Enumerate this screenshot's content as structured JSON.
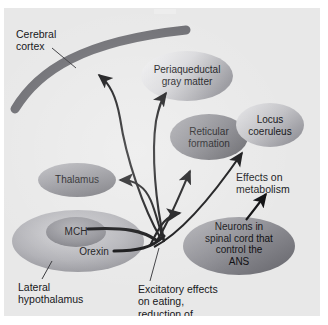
{
  "figure": {
    "type": "diagram",
    "background_color": "#e8e8e8",
    "page_color": "#ffffff"
  },
  "nodes": [
    {
      "id": "cerebral_cortex_band",
      "label": "",
      "shape": "arc-band",
      "color": "#6e6e73",
      "note": "thick curved band representing cortex"
    },
    {
      "id": "periaqueductal",
      "label": "Periaqueductal\ngray matter",
      "shape": "ellipse",
      "fill_light": "#f2f2f2",
      "fill_dark": "#9a9a9f"
    },
    {
      "id": "reticular",
      "label": "Reticular\nformation",
      "shape": "ellipse",
      "fill_light": "#9e9ea3",
      "fill_dark": "#6b6b70"
    },
    {
      "id": "locus",
      "label": "Locus\ncoeruleus",
      "shape": "ellipse",
      "fill_light": "#e3e3e5",
      "fill_dark": "#9d9da2"
    },
    {
      "id": "thalamus",
      "label": "Thalamus",
      "shape": "ellipse",
      "fill_light": "#b9b9bd",
      "fill_dark": "#76767b"
    },
    {
      "id": "lateral_hypothalamus",
      "label": "",
      "shape": "ellipse",
      "fill_light": "#c8c8cb",
      "fill_dark": "#8d8d92"
    },
    {
      "id": "mch_core",
      "label": "MCH",
      "shape": "ellipse",
      "fill_light": "#a7a7ac",
      "fill_dark": "#7a7a7f"
    },
    {
      "id": "orexin",
      "label": "Orexin",
      "shape": "text-on-ellipse"
    },
    {
      "id": "spinal_neurons",
      "label": "Neurons in\nspinal cord that\ncontrol the\nANS",
      "shape": "ellipse",
      "fill_light": "#a3a3a8",
      "fill_dark": "#74747a"
    }
  ],
  "callouts": [
    {
      "id": "cerebral_cortex_label",
      "text": "Cerebral\ncortex"
    },
    {
      "id": "lateral_hypothalamus_label",
      "text": "Lateral\nhypothalamus"
    },
    {
      "id": "excitatory_label",
      "text": "Excitatory effects\non eating,\nreduction of\nmetabolic rate"
    },
    {
      "id": "metabolism_label",
      "text": "Effects on\nmetabolism"
    }
  ],
  "edges": [
    {
      "from": "lateral_hypothalamus",
      "to": "cerebral_cortex_band",
      "style": "arrow"
    },
    {
      "from": "lateral_hypothalamus",
      "to": "periaqueductal",
      "style": "arrow"
    },
    {
      "from": "lateral_hypothalamus",
      "to": "thalamus",
      "style": "arrow"
    },
    {
      "from": "lateral_hypothalamus",
      "to": "reticular",
      "style": "arrow"
    },
    {
      "from": "lateral_hypothalamus",
      "to": "locus",
      "style": "arrow"
    },
    {
      "from": "lateral_hypothalamus",
      "to": "spinal_neurons",
      "style": "arrow"
    },
    {
      "from": "spinal_neurons",
      "to": "metabolism_label",
      "style": "arrow"
    }
  ],
  "colors": {
    "ink": "#17171a",
    "arrow": "#0a0a0c",
    "band": "#6e6e73",
    "leader": "#3a3a3e"
  }
}
